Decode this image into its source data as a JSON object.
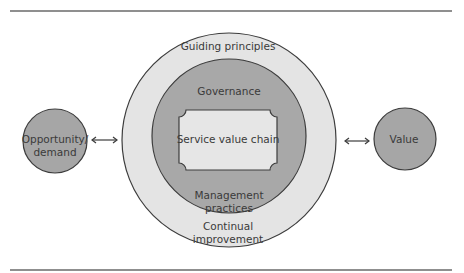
{
  "diagram": {
    "outer_ring": "Guiding principles",
    "outer_ring_bottom": [
      "Continual",
      "improvement"
    ],
    "inner_ring_top": "Governance",
    "inner_ring_bottom": [
      "Management",
      "practices"
    ],
    "center": "Service value chain",
    "left_node": [
      "Opportunity/",
      "demand"
    ],
    "right_node": "Value",
    "connectors": [
      "bidirectional-arrow-left",
      "bidirectional-arrow-right"
    ]
  },
  "colors": {
    "outer_fill": "#e4e4e4",
    "inner_fill": "#a8a8a8",
    "center_fill": "#e6e6e6",
    "node_fill": "#a6a6a6",
    "stroke": "#3c3c3c",
    "rule": "#6a6a6a"
  }
}
